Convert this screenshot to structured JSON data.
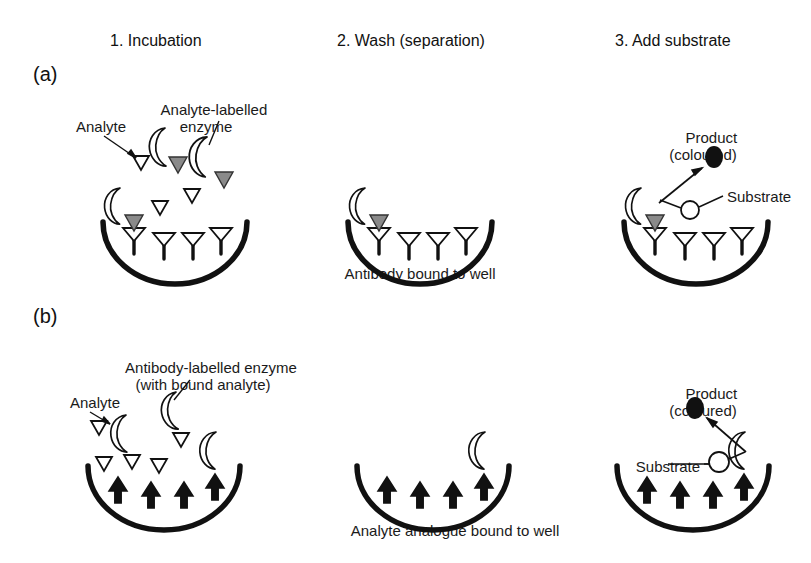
{
  "figure": {
    "background": "#ffffff",
    "ink": "#111111",
    "enzyme_fill": "#ffffff",
    "analyte_label_fill": "#8a8a8a",
    "product_colour": "#111111"
  },
  "columns": [
    {
      "id": "col1",
      "header": "1. Incubation"
    },
    {
      "id": "col2",
      "header": "2. Wash (separation)"
    },
    {
      "id": "col3",
      "header": "3. Add substrate"
    }
  ],
  "panels": [
    {
      "tag": "(a)",
      "format": "competitive ELISA, antibody coated well",
      "caption": "Antibody bound to well",
      "labels": {
        "analyte": "Analyte",
        "analyte_labelled_enzyme": "Analyte-labelled\nenzyme",
        "product": "Product\n(coloured)",
        "substrate": "Substrate"
      },
      "counts": {
        "bound_antibodies": 4,
        "free_analyte_triangles": 4,
        "free_enzyme_conjugates": 2,
        "bound_enzyme_conjugates": 1
      }
    },
    {
      "tag": "(b)",
      "format": "competitive ELISA, analyte analogue coated well",
      "caption": "Analyte analogue bound to well",
      "labels": {
        "analyte": "Analyte",
        "antibody_labelled_enzyme": "Antibody-labelled enzyme\n(with bound analyte)",
        "product": "Product\n(coloured)",
        "substrate": "Substrate"
      },
      "counts": {
        "bound_analyte_analogues": 4,
        "free_analyte_triangles": 4,
        "free_enzyme_conjugates": 3,
        "bound_enzyme_conjugates": 1
      }
    }
  ],
  "icons": {
    "analyte": "open-triangle-icon",
    "analyte_analogue": "black-arrow-icon",
    "antibody": "y-antibody-icon",
    "enzyme": "crescent-enzyme-icon",
    "substrate": "open-circle-icon",
    "product": "filled-ellipse-icon"
  }
}
